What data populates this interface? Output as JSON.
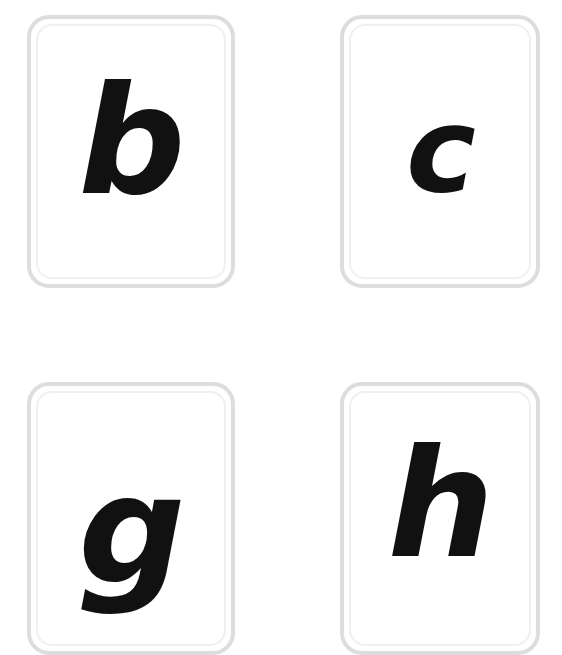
{
  "board": {
    "background_color": "#ffffff",
    "layout": "2x2-grid",
    "card_border_color": "#dddddd",
    "card_inner_border_color": "#f0f0f0",
    "card_face_color": "#ffffff",
    "letter_color": "#111111"
  },
  "cards": [
    {
      "id": "card-b",
      "letter": "b",
      "row": 1,
      "column": 1,
      "case": "lowercase"
    },
    {
      "id": "card-c",
      "letter": "c",
      "row": 1,
      "column": 2,
      "case": "lowercase"
    },
    {
      "id": "card-g",
      "letter": "g",
      "row": 2,
      "column": 1,
      "case": "lowercase"
    },
    {
      "id": "card-h",
      "letter": "h",
      "row": 2,
      "column": 2,
      "case": "lowercase"
    }
  ]
}
